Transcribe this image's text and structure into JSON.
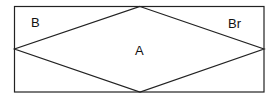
{
  "diagram": {
    "labels": {
      "top_left": "B",
      "top_right": "Br",
      "center": "A"
    },
    "colors": {
      "stroke": "#222222",
      "background": "#ffffff"
    },
    "shapes": {
      "rectangle": {
        "x": 14,
        "y": 6,
        "width": 250,
        "height": 86
      },
      "diamond": {
        "top": [
          140,
          6
        ],
        "right": [
          264,
          49
        ],
        "bottom": [
          140,
          92
        ],
        "left": [
          14,
          49
        ]
      }
    }
  }
}
